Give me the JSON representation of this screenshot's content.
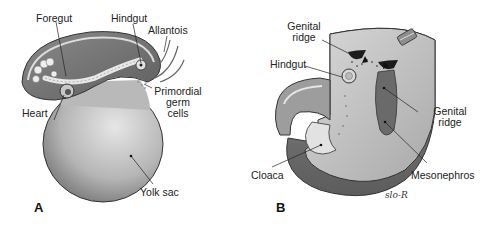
{
  "figure": {
    "panels": [
      {
        "id": "A",
        "label": "A",
        "labels": {
          "foregut": "Foregut",
          "hindgut": "Hindgut",
          "allantois": "Allantois",
          "primordial_germ_cells_line1": "Primordial",
          "primordial_germ_cells_line2": "germ",
          "primordial_germ_cells_line3": "cells",
          "heart": "Heart",
          "yolk_sac": "Yolk sac"
        }
      },
      {
        "id": "B",
        "label": "B",
        "labels": {
          "genital_ridge_top_line1": "Genital",
          "genital_ridge_top_line2": "ridge",
          "hindgut": "Hindgut",
          "genital_ridge_right_line1": "Genital",
          "genital_ridge_right_line2": "ridge",
          "cloaca": "Cloaca",
          "mesonephros": "Mesonephros"
        },
        "signature": "slo-R"
      }
    ],
    "colors": {
      "outline": "#333333",
      "tissue_dark": "#6b6b6b",
      "tissue_mid": "#9a9a9a",
      "tissue_light": "#cfcfcf",
      "leader_line": "#222222"
    }
  }
}
